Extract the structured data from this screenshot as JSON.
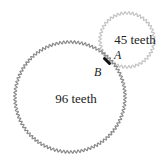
{
  "diagram": {
    "large_gear": {
      "label": "96 teeth",
      "teeth": 96,
      "cx": 70,
      "cy": 97,
      "r": 55,
      "color": "#8a8a8a"
    },
    "small_gear": {
      "label": "45 teeth",
      "teeth": 45,
      "cx": 127,
      "cy": 40,
      "r": 27,
      "color": "#c4c4c4"
    },
    "point_a": {
      "label": "A"
    },
    "point_b": {
      "label": "B"
    },
    "contact_marker_color": "#111111"
  }
}
